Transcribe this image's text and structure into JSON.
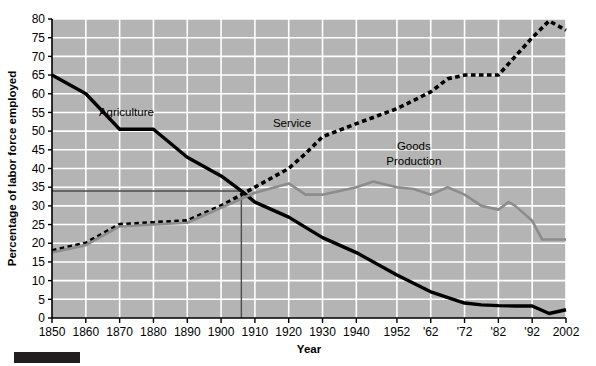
{
  "chart_data": {
    "type": "line",
    "title": "",
    "xlabel": "Year",
    "ylabel": "Percentage of labor force employed",
    "xlim": [
      1850,
      2002
    ],
    "ylim": [
      0,
      80
    ],
    "ytick_step": 5,
    "grid": true,
    "legend_position": "inline-annotations",
    "background_color": "#b4b4b4",
    "gridline_color": "#ffffff",
    "xticks": [
      1850,
      1860,
      1870,
      1880,
      1890,
      1900,
      1910,
      1920,
      1930,
      1940,
      1952,
      1962,
      1972,
      1982,
      1992,
      2002
    ],
    "xtick_labels": [
      "1850",
      "1860",
      "1870",
      "1880",
      "1890",
      "1900",
      "1910",
      "1920",
      "1930",
      "1940",
      "1952",
      "'62",
      "'72",
      "'82",
      "'92",
      "2002"
    ],
    "yticks": [
      0,
      5,
      10,
      15,
      20,
      25,
      30,
      35,
      40,
      45,
      50,
      55,
      60,
      65,
      70,
      75,
      80
    ],
    "ytick_labels": [
      "0",
      "5",
      "10",
      "15",
      "20",
      "25",
      "30",
      "35",
      "40",
      "45",
      "50",
      "55",
      "60",
      "65",
      "70",
      "75",
      "80"
    ],
    "reference_lines": {
      "horizontal_value": 34,
      "vertical_value": 1906,
      "color": "#4d4d4d"
    },
    "series": [
      {
        "name": "Agriculture",
        "style": "solid",
        "color": "#000000",
        "width": 3.4,
        "label_x": 1872,
        "label_y": 54,
        "points": [
          [
            1850,
            65
          ],
          [
            1860,
            60
          ],
          [
            1870,
            50.5
          ],
          [
            1880,
            50.5
          ],
          [
            1890,
            43
          ],
          [
            1900,
            38
          ],
          [
            1906,
            34
          ],
          [
            1910,
            31
          ],
          [
            1920,
            27
          ],
          [
            1930,
            21.5
          ],
          [
            1940,
            17.5
          ],
          [
            1952,
            11.5
          ],
          [
            1962,
            7
          ],
          [
            1972,
            4
          ],
          [
            1977,
            3.5
          ],
          [
            1982,
            3.3
          ],
          [
            1987,
            3.2
          ],
          [
            1992,
            3.2
          ],
          [
            1997,
            1.2
          ],
          [
            2002,
            2.2
          ]
        ]
      },
      {
        "name": "Service",
        "style": "dashed",
        "color": "#000000",
        "width": 3.6,
        "label_x": 1921,
        "label_y": 51,
        "points": [
          [
            1850,
            18
          ],
          [
            1860,
            20
          ],
          [
            1870,
            25
          ],
          [
            1880,
            25.5
          ],
          [
            1890,
            26
          ],
          [
            1900,
            30
          ],
          [
            1906,
            33
          ],
          [
            1910,
            35
          ],
          [
            1920,
            40
          ],
          [
            1925,
            44
          ],
          [
            1930,
            48.5
          ],
          [
            1940,
            52
          ],
          [
            1952,
            56
          ],
          [
            1962,
            60.5
          ],
          [
            1967,
            64
          ],
          [
            1972,
            65
          ],
          [
            1982,
            65
          ],
          [
            1987,
            70
          ],
          [
            1992,
            75
          ],
          [
            1997,
            79.5
          ],
          [
            2002,
            77
          ]
        ]
      },
      {
        "name": "Goods Production",
        "style": "solid",
        "color": "#8c8c8c",
        "width": 2.6,
        "label_x": 1957,
        "label_y": 44,
        "label_line2": "Production",
        "points": [
          [
            1850,
            17.5
          ],
          [
            1860,
            19.5
          ],
          [
            1870,
            24.5
          ],
          [
            1880,
            25
          ],
          [
            1890,
            25.5
          ],
          [
            1900,
            29.5
          ],
          [
            1910,
            33.5
          ],
          [
            1920,
            36
          ],
          [
            1925,
            33
          ],
          [
            1930,
            33
          ],
          [
            1940,
            35
          ],
          [
            1945,
            36.5
          ],
          [
            1952,
            35
          ],
          [
            1957,
            34.5
          ],
          [
            1962,
            33
          ],
          [
            1967,
            35
          ],
          [
            1972,
            33
          ],
          [
            1977,
            30
          ],
          [
            1982,
            29
          ],
          [
            1985,
            31
          ],
          [
            1987,
            30
          ],
          [
            1992,
            26
          ],
          [
            1995,
            21
          ],
          [
            1997,
            21
          ],
          [
            2002,
            21
          ]
        ]
      }
    ],
    "annotations": [
      {
        "text": "Agriculture",
        "x": 1872,
        "y": 54
      },
      {
        "text": "Service",
        "x": 1921,
        "y": 51
      },
      {
        "text": "Goods",
        "x": 1957,
        "y": 45
      },
      {
        "text": "Production",
        "x": 1957,
        "y": 41
      }
    ]
  }
}
